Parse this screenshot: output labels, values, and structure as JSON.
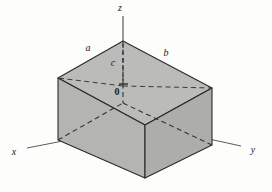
{
  "figure": {
    "caption": "",
    "background_color": "#fdfdfc",
    "axes": [
      {
        "name": "x-axis",
        "label": "x",
        "label_x": 14,
        "label_y": 155,
        "from": [
          145,
          125
        ],
        "to": [
          27,
          148
        ]
      },
      {
        "name": "y-axis",
        "label": "y",
        "label_x": 253,
        "label_y": 153,
        "from": [
          145,
          125
        ],
        "to": [
          241,
          146
        ]
      },
      {
        "name": "z-axis",
        "label": "z",
        "label_x": 120,
        "label_y": 11,
        "from": [
          123,
          41
        ],
        "to": [
          123,
          16
        ]
      }
    ],
    "dimensions": [
      {
        "name": "edge-a",
        "label": "a",
        "label_x": 88,
        "label_y": 51
      },
      {
        "name": "edge-b",
        "label": "b",
        "label_x": 166,
        "label_y": 56
      },
      {
        "name": "edge-c",
        "label": "c",
        "label_x": 113,
        "label_y": 66
      }
    ],
    "origin": {
      "label": "0",
      "label_x": 117,
      "label_y": 92
    },
    "box": {
      "name": "rectangular-parallelepiped",
      "top_face_color": "#b9b9b7",
      "left_face_color": "#b3b3b1",
      "right_face_color": "#acacaa",
      "edge_color": "#2a2a2a",
      "hidden_edge_color": "#3a3a3a",
      "vertices": {
        "top_back": [
          123,
          41
        ],
        "top_left": [
          58,
          78
        ],
        "top_front": [
          145,
          125
        ],
        "top_right": [
          212,
          88
        ],
        "bot_left": [
          58,
          140
        ],
        "bot_front": [
          145,
          178
        ],
        "bot_right": [
          212,
          145
        ],
        "bot_back": [
          123,
          103
        ]
      }
    }
  }
}
